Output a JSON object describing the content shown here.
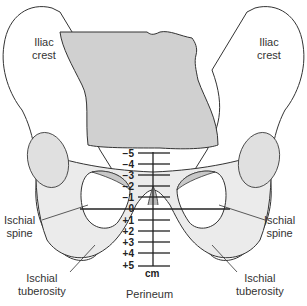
{
  "labels": {
    "iliac_crest_left": [
      "Iliac",
      "crest"
    ],
    "iliac_crest_right": [
      "Iliac",
      "crest"
    ],
    "ischial_spine_left": [
      "Ischial",
      "spine"
    ],
    "ischial_spine_right": [
      "Ischial",
      "spine"
    ],
    "ischial_tuberosity_left": [
      "Ischial",
      "tuberosity"
    ],
    "ischial_tuberosity_right": [
      "Ischial",
      "tuberosity"
    ],
    "perineum": "Perineum"
  },
  "scale": {
    "ticks": [
      "−5",
      "−4",
      "−3",
      "−2",
      "−1",
      "0",
      "+1",
      "+2",
      "+3",
      "+4",
      "+5"
    ],
    "unit": "cm"
  },
  "colors": {
    "bone": "#ffffff",
    "bone_shade": "#e8e8e8",
    "sacrum": "#d0d0d0",
    "foramen_shade": "#c8c8c8",
    "outline": "#333333"
  }
}
